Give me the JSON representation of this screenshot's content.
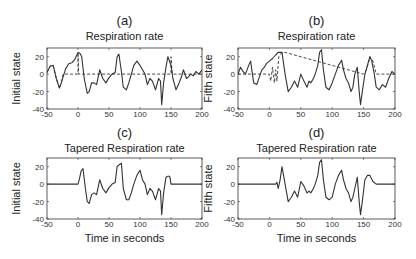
{
  "figure": {
    "xlabel": "Time in seconds"
  },
  "chart_data": [
    {
      "id": "a",
      "type": "line",
      "letter": "(a)",
      "title": "Respiration rate",
      "ylabel": "Initial state",
      "xlim": [
        -50,
        200
      ],
      "ylim": [
        -40,
        30
      ],
      "xticks": [
        -50,
        0,
        50,
        100,
        150,
        200
      ],
      "yticks": [
        -40,
        -20,
        0,
        20
      ],
      "series": [
        {
          "name": "solid",
          "style": "solid",
          "x": [
            -50,
            -45,
            -40,
            -35,
            -30,
            -27,
            -24,
            -20,
            -15,
            -10,
            -5,
            0,
            3,
            6,
            10,
            15,
            18,
            22,
            26,
            30,
            35,
            40,
            45,
            50,
            55,
            60,
            63,
            66,
            70,
            73,
            78,
            82,
            86,
            90,
            95,
            100,
            104,
            108,
            112,
            116,
            120,
            125,
            130,
            133,
            135,
            138,
            142,
            145,
            150,
            153,
            158,
            163,
            167,
            170,
            175,
            178,
            182,
            186,
            190,
            195,
            200
          ],
          "y": [
            2,
            9,
            10,
            -5,
            -16,
            -10,
            -3,
            6,
            12,
            13,
            17,
            25,
            24,
            20,
            -5,
            -22,
            -20,
            -10,
            -10,
            -12,
            5,
            -5,
            -10,
            -4,
            0,
            2,
            20,
            23,
            3,
            -15,
            -18,
            -10,
            0,
            10,
            15,
            10,
            5,
            0,
            -12,
            -5,
            -8,
            -18,
            -5,
            -8,
            -35,
            -10,
            8,
            20,
            10,
            -5,
            -18,
            -10,
            -3,
            5,
            -5,
            -3,
            0,
            -2,
            3,
            0,
            5
          ]
        },
        {
          "name": "dashed",
          "style": "dashed",
          "x": [
            -50,
            -45,
            -40,
            -35,
            -30,
            -27,
            -24,
            -20,
            -15,
            -10,
            -5,
            0,
            0,
            1,
            150,
            150,
            152,
            200
          ],
          "y": [
            2,
            9,
            10,
            -5,
            -16,
            -10,
            0,
            0,
            0,
            0,
            0,
            0,
            25,
            0,
            0,
            20,
            0,
            0
          ]
        }
      ]
    },
    {
      "id": "b",
      "type": "line",
      "letter": "(b)",
      "title": "Respiration rate",
      "ylabel": "Fifth state",
      "xlim": [
        -50,
        200
      ],
      "ylim": [
        -40,
        30
      ],
      "xticks": [
        -50,
        0,
        50,
        100,
        150,
        200
      ],
      "yticks": [
        -40,
        -20,
        0,
        20
      ],
      "series": [
        {
          "name": "solid",
          "style": "solid",
          "x": [
            -50,
            -46,
            -42,
            -38,
            -33,
            -30,
            -25,
            -20,
            -16,
            -12,
            -8,
            -5,
            0,
            5,
            10,
            14,
            17,
            20,
            25,
            30,
            35,
            40,
            45,
            50,
            55,
            60,
            63,
            66,
            70,
            73,
            77,
            80,
            83,
            86,
            90,
            95,
            100,
            105,
            110,
            115,
            118,
            122,
            126,
            130,
            133,
            136,
            140,
            143,
            145,
            148,
            152,
            156,
            160,
            163,
            167,
            170,
            175,
            180,
            185,
            190,
            195,
            200
          ],
          "y": [
            0,
            8,
            3,
            0,
            10,
            15,
            -10,
            -12,
            -3,
            5,
            8,
            12,
            15,
            18,
            22,
            25,
            25,
            25,
            0,
            -20,
            -15,
            -8,
            -15,
            0,
            -8,
            -15,
            -8,
            -10,
            -5,
            0,
            10,
            25,
            28,
            5,
            -15,
            -18,
            -10,
            0,
            10,
            16,
            5,
            -5,
            -10,
            -20,
            -15,
            0,
            8,
            -20,
            -35,
            -20,
            0,
            10,
            20,
            15,
            0,
            -15,
            -18,
            -12,
            -15,
            -5,
            3,
            0
          ]
        },
        {
          "name": "dashed",
          "style": "dashed",
          "x": [
            -50,
            -40,
            -30,
            -20,
            -10,
            0,
            2,
            5,
            8,
            10,
            12,
            15,
            20,
            25,
            150,
            155,
            160,
            165,
            170,
            180,
            190,
            200
          ],
          "y": [
            0,
            0,
            0,
            0,
            0,
            0,
            -8,
            8,
            -10,
            5,
            -8,
            20,
            25,
            25,
            0,
            5,
            20,
            15,
            0,
            0,
            0,
            0
          ]
        }
      ]
    },
    {
      "id": "c",
      "type": "line",
      "letter": "(c)",
      "title": "Tapered Respiration rate",
      "ylabel": "Initial state",
      "xlabel": "Time in seconds",
      "xlim": [
        -50,
        200
      ],
      "ylim": [
        -40,
        30
      ],
      "xticks": [
        -50,
        0,
        50,
        100,
        150,
        200
      ],
      "yticks": [
        -40,
        -20,
        0,
        20
      ],
      "series": [
        {
          "name": "solid",
          "style": "solid",
          "x": [
            -50,
            0,
            2,
            5,
            8,
            12,
            15,
            18,
            22,
            26,
            30,
            35,
            40,
            45,
            50,
            55,
            60,
            63,
            66,
            70,
            73,
            78,
            82,
            86,
            90,
            95,
            100,
            104,
            108,
            112,
            116,
            120,
            125,
            130,
            133,
            135,
            138,
            142,
            145,
            148,
            150,
            152,
            155,
            200
          ],
          "y": [
            0,
            0,
            5,
            15,
            18,
            -5,
            -20,
            -22,
            -12,
            -10,
            -12,
            5,
            -5,
            -10,
            -4,
            0,
            2,
            20,
            22,
            24,
            -5,
            -18,
            -18,
            -10,
            0,
            10,
            16,
            5,
            0,
            -12,
            -5,
            -8,
            -18,
            -5,
            -8,
            -35,
            -10,
            8,
            9,
            9,
            0,
            0,
            0,
            0
          ]
        }
      ]
    },
    {
      "id": "d",
      "type": "line",
      "letter": "(d)",
      "title": "Tapered Respiration rate",
      "ylabel": "Fifth state",
      "xlabel": "Time in seconds",
      "xlim": [
        -50,
        200
      ],
      "ylim": [
        -40,
        30
      ],
      "xticks": [
        -50,
        0,
        50,
        100,
        150,
        200
      ],
      "yticks": [
        -40,
        -20,
        0,
        20
      ],
      "series": [
        {
          "name": "solid",
          "style": "solid",
          "x": [
            -50,
            10,
            12,
            14,
            17,
            20,
            25,
            30,
            35,
            40,
            45,
            50,
            55,
            60,
            63,
            66,
            70,
            73,
            77,
            80,
            83,
            86,
            90,
            95,
            100,
            105,
            110,
            115,
            118,
            122,
            126,
            130,
            133,
            136,
            140,
            143,
            145,
            148,
            152,
            156,
            160,
            165,
            170,
            175,
            200
          ],
          "y": [
            0,
            0,
            2,
            -5,
            5,
            20,
            0,
            -20,
            -15,
            -8,
            -15,
            3,
            -2,
            -10,
            -8,
            -10,
            -5,
            0,
            10,
            25,
            28,
            5,
            -15,
            -18,
            -15,
            0,
            10,
            16,
            5,
            -5,
            -10,
            -20,
            -15,
            -5,
            8,
            -20,
            -35,
            -20,
            5,
            10,
            10,
            3,
            0,
            0,
            0
          ]
        }
      ]
    }
  ]
}
